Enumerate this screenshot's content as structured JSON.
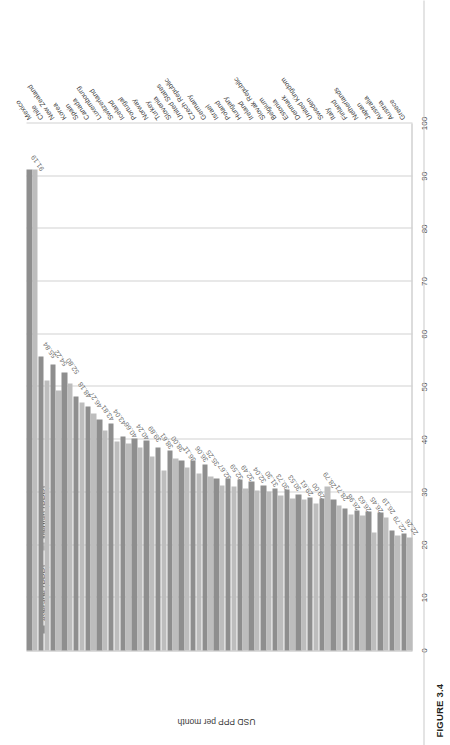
{
  "figure": {
    "caption": "FIGURE 3.4"
  },
  "chart_data": {
    "type": "bar",
    "orientation": "vertical-rotated",
    "title": "",
    "xlabel": "",
    "ylabel": "USD PPP per month",
    "ylim": [
      0,
      100
    ],
    "yticks": [
      0,
      10,
      20,
      30,
      40,
      50,
      60,
      70,
      80,
      90,
      100
    ],
    "grid": true,
    "legend_position": "top-left",
    "colors": {
      "average": "#8e8e8e",
      "median": "#bdbdbd"
    },
    "legend": [
      {
        "name": "Average (PPP)",
        "color": "#8e8e8e"
      },
      {
        "name": "Median (PPP)",
        "color": "#bdbdbd"
      }
    ],
    "categories": [
      "Mexico",
      "Chile",
      "New Zealand",
      "Korea",
      "Spain",
      "Canada",
      "Luxembourg",
      "Switzerland",
      "Iceland",
      "Portugal",
      "Norway",
      "Turkey",
      "Slovenia",
      "United States",
      "Czech Republic",
      "Germany",
      "Israel",
      "Poland",
      "Hungary",
      "Ireland",
      "Slovak Republic",
      "Belgium",
      "Estonia",
      "Denmark",
      "United Kingdom",
      "Sweden",
      "Italy",
      "Finland",
      "Netherlands",
      "Japan",
      "Australia",
      "Austria",
      "Greece"
    ],
    "series": [
      {
        "name": "Average (PPP)",
        "values": [
          91.19,
          55.84,
          54.22,
          52.8,
          48.18,
          46.27,
          43.81,
          43.04,
          40.66,
          40.24,
          39.89,
          38.61,
          38.0,
          36.11,
          36.06,
          35.25,
          32.67,
          32.59,
          32.49,
          32.04,
          31.3,
          30.73,
          30.53,
          29.61,
          29.0,
          28.79,
          28.71,
          26.98,
          26.63,
          26.45,
          26.19,
          22.79,
          22.26
        ]
      },
      {
        "name": "Median (PPP)",
        "values": [
          91.19,
          51.2,
          49.4,
          50.6,
          47.1,
          44.9,
          41.8,
          39.6,
          39.3,
          38.5,
          36.9,
          34.2,
          36.4,
          34.8,
          33.6,
          33.1,
          31.4,
          31.2,
          30.8,
          30.4,
          30.2,
          29.5,
          28.9,
          28.6,
          27.9,
          31.1,
          27.6,
          25.9,
          25.6,
          22.3,
          25.2,
          21.9,
          21.4
        ]
      }
    ],
    "value_labels": [
      "91.19",
      "55.84",
      "54.22",
      "52.80",
      "48.18",
      "46.27",
      "43.81",
      "43.04",
      "40.66",
      "40.24",
      "39.89",
      "38.61",
      "38.00",
      "36.11",
      "36.06",
      "35.25",
      "32.67",
      "32.59",
      "32.49",
      "32.04",
      "31.30",
      "30.73",
      "30.53",
      "29.61",
      "29.00",
      "28.79",
      "28.71",
      "26.98",
      "26.63",
      "26.45",
      "26.19",
      "22.79",
      "22.26"
    ]
  }
}
